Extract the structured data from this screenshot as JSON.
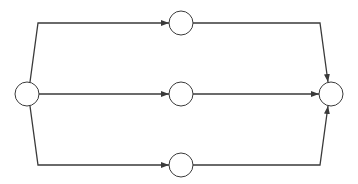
{
  "diagram": {
    "type": "directed-graph",
    "stroke_color": "#3a3a3a",
    "background": "#ffffff",
    "node_radius": 12,
    "nodes": [
      {
        "id": "source",
        "label": "",
        "x": 27,
        "y": 94
      },
      {
        "id": "top",
        "label": "",
        "x": 181,
        "y": 23
      },
      {
        "id": "middle",
        "label": "",
        "x": 181,
        "y": 94
      },
      {
        "id": "bottom",
        "label": "",
        "x": 181,
        "y": 165
      },
      {
        "id": "sink",
        "label": "",
        "x": 331,
        "y": 94
      }
    ],
    "edges": [
      {
        "from": "source",
        "to": "top",
        "points": [
          [
            30,
            82
          ],
          [
            38,
            23
          ],
          [
            169,
            23
          ]
        ]
      },
      {
        "from": "source",
        "to": "middle",
        "points": [
          [
            39,
            94
          ],
          [
            169,
            94
          ]
        ]
      },
      {
        "from": "source",
        "to": "bottom",
        "points": [
          [
            30,
            106
          ],
          [
            38,
            165
          ],
          [
            169,
            165
          ]
        ]
      },
      {
        "from": "top",
        "to": "sink",
        "points": [
          [
            193,
            23
          ],
          [
            320,
            23
          ],
          [
            328,
            82
          ]
        ]
      },
      {
        "from": "middle",
        "to": "sink",
        "points": [
          [
            193,
            94
          ],
          [
            319,
            94
          ]
        ]
      },
      {
        "from": "bottom",
        "to": "sink",
        "points": [
          [
            193,
            165
          ],
          [
            320,
            165
          ],
          [
            328,
            106
          ]
        ]
      }
    ]
  }
}
